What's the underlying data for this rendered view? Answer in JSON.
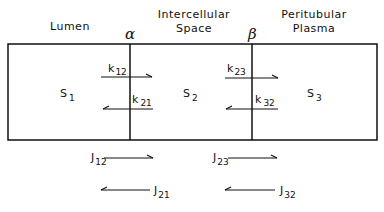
{
  "headers": {
    "lumen": "Lumen",
    "intercellular_line1": "Intercellular",
    "intercellular_line2": "Space",
    "peritubular_line1": "Peritubular",
    "peritubular_line2": "Plasma"
  },
  "boundaries": {
    "alpha": "α",
    "beta": "β"
  },
  "compartments": [
    {
      "base": "S",
      "sub": "1"
    },
    {
      "base": "S",
      "sub": "2"
    },
    {
      "base": "S",
      "sub": "3"
    }
  ],
  "rate_constants": [
    {
      "base": "k",
      "sub": "12",
      "direction": "right"
    },
    {
      "base": "k",
      "sub": "21",
      "direction": "left"
    },
    {
      "base": "k",
      "sub": "23",
      "direction": "right"
    },
    {
      "base": "k",
      "sub": "32",
      "direction": "left"
    }
  ],
  "fluxes": [
    {
      "base": "J",
      "sub": "12",
      "direction": "right"
    },
    {
      "base": "J",
      "sub": "21",
      "direction": "left"
    },
    {
      "base": "J",
      "sub": "23",
      "direction": "right"
    },
    {
      "base": "J",
      "sub": "32",
      "direction": "left"
    }
  ]
}
